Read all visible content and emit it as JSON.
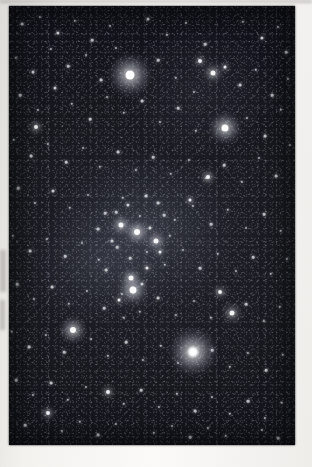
{
  "image": {
    "kind": "photograph-scan",
    "subject": "Orion constellation night sky star field",
    "caption": "",
    "background_color": "#f2f0ed",
    "sky_color": "#14151b",
    "star_color": "#ffffff",
    "frame": {
      "x": 9,
      "y": 6,
      "width": 286,
      "height": 439
    }
  },
  "photo": {
    "nebulosity": [
      {
        "name": "belt-sword-glow",
        "cx": 48,
        "cy": 51,
        "rx": 30,
        "ry": 17,
        "alpha": 0.2
      },
      {
        "name": "west-glow",
        "cx": 31,
        "cy": 59,
        "rx": 23,
        "ry": 13,
        "alpha": 0.14
      },
      {
        "name": "north-glow",
        "cx": 67,
        "cy": 19,
        "rx": 27,
        "ry": 15,
        "alpha": 0.1
      }
    ],
    "bright_stars": [
      {
        "name": "betelgeuse",
        "x": 130,
        "y": 75,
        "size": 9,
        "halo": 40,
        "intensity": 1.0
      },
      {
        "name": "rigel",
        "x": 193,
        "y": 352,
        "size": 10,
        "halo": 46,
        "intensity": 1.0
      },
      {
        "name": "bellatrix",
        "x": 225,
        "y": 128,
        "size": 7,
        "halo": 30,
        "intensity": 0.9
      },
      {
        "name": "saiph",
        "x": 73,
        "y": 330,
        "size": 6,
        "halo": 26,
        "intensity": 0.82
      },
      {
        "name": "mintaka",
        "x": 137,
        "y": 232,
        "size": 6,
        "halo": 22,
        "intensity": 0.85
      },
      {
        "name": "alnilam",
        "x": 121,
        "y": 225,
        "size": 5,
        "halo": 17,
        "intensity": 0.75
      },
      {
        "name": "alnitak",
        "x": 156,
        "y": 241,
        "size": 5,
        "halo": 16,
        "intensity": 0.72
      },
      {
        "name": "orion-nebula",
        "x": 133,
        "y": 290,
        "size": 7,
        "halo": 24,
        "intensity": 0.9
      },
      {
        "name": "sword-star",
        "x": 131,
        "y": 278,
        "size": 5,
        "halo": 15,
        "intensity": 0.76
      },
      {
        "name": "meissa",
        "x": 213,
        "y": 73,
        "size": 5,
        "halo": 16,
        "intensity": 0.72
      },
      {
        "name": "phi-orionis",
        "x": 208,
        "y": 177,
        "size": 4,
        "halo": 13,
        "intensity": 0.62
      },
      {
        "name": "eta-leporis",
        "x": 232,
        "y": 313,
        "size": 5,
        "halo": 15,
        "intensity": 0.68
      },
      {
        "name": "tau-orionis",
        "x": 220,
        "y": 292,
        "size": 4,
        "halo": 11,
        "intensity": 0.58
      },
      {
        "name": "pi-orionis",
        "x": 48,
        "y": 413,
        "size": 4,
        "halo": 12,
        "intensity": 0.6
      },
      {
        "name": "delta-leporis",
        "x": 108,
        "y": 392,
        "size": 4,
        "halo": 11,
        "intensity": 0.56
      },
      {
        "name": "cursa",
        "x": 36,
        "y": 127,
        "size": 4,
        "halo": 11,
        "intensity": 0.55
      },
      {
        "name": "zeta-tauri",
        "x": 200,
        "y": 61,
        "size": 4,
        "halo": 10,
        "intensity": 0.54
      },
      {
        "name": "chi-orionis",
        "x": 225,
        "y": 67,
        "size": 3,
        "halo": 8,
        "intensity": 0.5
      },
      {
        "name": "nu-orionis",
        "x": 190,
        "y": 200,
        "size": 3,
        "halo": 9,
        "intensity": 0.5
      },
      {
        "name": "sigma-orionis",
        "x": 160,
        "y": 252,
        "size": 3,
        "halo": 8,
        "intensity": 0.48
      },
      {
        "name": "iota-orionis",
        "x": 119,
        "y": 300,
        "size": 3,
        "halo": 8,
        "intensity": 0.48
      },
      {
        "name": "upsilon-orionis",
        "x": 147,
        "y": 268,
        "size": 3,
        "halo": 7,
        "intensity": 0.46
      }
    ],
    "field_stars": [
      [
        22,
        24,
        1.4
      ],
      [
        40,
        17,
        1.1
      ],
      [
        58,
        33,
        1.6
      ],
      [
        75,
        21,
        1.2
      ],
      [
        92,
        40,
        1.3
      ],
      [
        110,
        26,
        1.0
      ],
      [
        148,
        19,
        1.5
      ],
      [
        167,
        35,
        1.2
      ],
      [
        186,
        23,
        1.1
      ],
      [
        205,
        44,
        1.3
      ],
      [
        243,
        22,
        1.2
      ],
      [
        262,
        38,
        1.6
      ],
      [
        278,
        27,
        1.1
      ],
      [
        286,
        52,
        1.3
      ],
      [
        16,
        58,
        1.2
      ],
      [
        33,
        72,
        1.5
      ],
      [
        51,
        49,
        1.1
      ],
      [
        68,
        66,
        1.3
      ],
      [
        86,
        55,
        1.0
      ],
      [
        101,
        80,
        1.4
      ],
      [
        116,
        48,
        1.1
      ],
      [
        158,
        60,
        1.3
      ],
      [
        176,
        78,
        1.2
      ],
      [
        194,
        92,
        1.1
      ],
      [
        240,
        85,
        1.4
      ],
      [
        256,
        70,
        1.2
      ],
      [
        272,
        95,
        1.3
      ],
      [
        288,
        79,
        1.1
      ],
      [
        20,
        95,
        1.3
      ],
      [
        38,
        110,
        1.1
      ],
      [
        55,
        88,
        1.5
      ],
      [
        72,
        104,
        1.2
      ],
      [
        90,
        119,
        1.3
      ],
      [
        107,
        97,
        1.0
      ],
      [
        124,
        113,
        1.2
      ],
      [
        142,
        101,
        1.4
      ],
      [
        160,
        122,
        1.1
      ],
      [
        178,
        108,
        1.3
      ],
      [
        196,
        131,
        1.2
      ],
      [
        247,
        118,
        1.1
      ],
      [
        265,
        136,
        1.4
      ],
      [
        281,
        110,
        1.2
      ],
      [
        14,
        140,
        1.2
      ],
      [
        31,
        156,
        1.4
      ],
      [
        48,
        144,
        1.1
      ],
      [
        66,
        162,
        1.3
      ],
      [
        83,
        148,
        1.0
      ],
      [
        100,
        167,
        1.2
      ],
      [
        118,
        152,
        1.4
      ],
      [
        136,
        170,
        1.1
      ],
      [
        153,
        157,
        1.3
      ],
      [
        171,
        174,
        1.2
      ],
      [
        189,
        160,
        1.1
      ],
      [
        206,
        178,
        1.0
      ],
      [
        224,
        165,
        1.3
      ],
      [
        242,
        182,
        1.2
      ],
      [
        259,
        158,
        1.1
      ],
      [
        276,
        176,
        1.4
      ],
      [
        290,
        145,
        1.1
      ],
      [
        18,
        188,
        1.3
      ],
      [
        35,
        203,
        1.1
      ],
      [
        53,
        191,
        1.5
      ],
      [
        70,
        208,
        1.2
      ],
      [
        88,
        195,
        1.0
      ],
      [
        105,
        213,
        1.3
      ],
      [
        123,
        198,
        1.2
      ],
      [
        140,
        216,
        1.1
      ],
      [
        158,
        203,
        1.4
      ],
      [
        175,
        220,
        1.2
      ],
      [
        193,
        206,
        1.1
      ],
      [
        211,
        224,
        1.3
      ],
      [
        228,
        210,
        1.2
      ],
      [
        246,
        228,
        1.0
      ],
      [
        264,
        214,
        1.3
      ],
      [
        281,
        231,
        1.2
      ],
      [
        13,
        236,
        1.2
      ],
      [
        30,
        251,
        1.4
      ],
      [
        47,
        239,
        1.1
      ],
      [
        65,
        256,
        1.3
      ],
      [
        82,
        243,
        1.0
      ],
      [
        99,
        260,
        1.2
      ],
      [
        117,
        247,
        1.3
      ],
      [
        147,
        252,
        1.1
      ],
      [
        165,
        265,
        1.2
      ],
      [
        183,
        250,
        1.0
      ],
      [
        200,
        268,
        1.3
      ],
      [
        218,
        254,
        1.2
      ],
      [
        236,
        271,
        1.1
      ],
      [
        253,
        257,
        1.3
      ],
      [
        271,
        274,
        1.2
      ],
      [
        287,
        259,
        1.1
      ],
      [
        17,
        284,
        1.3
      ],
      [
        34,
        299,
        1.1
      ],
      [
        52,
        287,
        1.4
      ],
      [
        69,
        304,
        1.2
      ],
      [
        87,
        291,
        1.0
      ],
      [
        104,
        308,
        1.3
      ],
      [
        122,
        294,
        1.1
      ],
      [
        140,
        312,
        1.2
      ],
      [
        158,
        298,
        1.4
      ],
      [
        176,
        315,
        1.1
      ],
      [
        194,
        301,
        1.0
      ],
      [
        211,
        318,
        1.2
      ],
      [
        246,
        304,
        1.3
      ],
      [
        264,
        321,
        1.1
      ],
      [
        280,
        307,
        1.2
      ],
      [
        12,
        332,
        1.2
      ],
      [
        29,
        347,
        1.4
      ],
      [
        46,
        335,
        1.1
      ],
      [
        64,
        352,
        1.3
      ],
      [
        91,
        339,
        1.0
      ],
      [
        108,
        356,
        1.2
      ],
      [
        126,
        342,
        1.3
      ],
      [
        143,
        360,
        1.1
      ],
      [
        161,
        346,
        1.2
      ],
      [
        178,
        363,
        1.0
      ],
      [
        212,
        350,
        1.3
      ],
      [
        230,
        367,
        1.2
      ],
      [
        248,
        353,
        1.1
      ],
      [
        266,
        370,
        1.3
      ],
      [
        283,
        355,
        1.2
      ],
      [
        16,
        380,
        1.3
      ],
      [
        33,
        395,
        1.1
      ],
      [
        51,
        383,
        1.4
      ],
      [
        68,
        400,
        1.2
      ],
      [
        86,
        387,
        1.0
      ],
      [
        124,
        404,
        1.2
      ],
      [
        141,
        390,
        1.3
      ],
      [
        159,
        407,
        1.1
      ],
      [
        177,
        394,
        1.2
      ],
      [
        195,
        411,
        1.4
      ],
      [
        212,
        397,
        1.1
      ],
      [
        230,
        414,
        1.2
      ],
      [
        248,
        401,
        1.3
      ],
      [
        265,
        418,
        1.1
      ],
      [
        282,
        403,
        1.2
      ],
      [
        25,
        425,
        1.3
      ],
      [
        62,
        431,
        1.1
      ],
      [
        80,
        422,
        1.2
      ],
      [
        98,
        435,
        1.4
      ],
      [
        116,
        424,
        1.1
      ],
      [
        154,
        433,
        1.2
      ],
      [
        172,
        426,
        1.0
      ],
      [
        190,
        437,
        1.3
      ],
      [
        208,
        428,
        1.1
      ],
      [
        226,
        436,
        1.2
      ],
      [
        262,
        430,
        1.1
      ],
      [
        278,
        438,
        1.3
      ],
      [
        128,
        205,
        1.6
      ],
      [
        146,
        196,
        1.4
      ],
      [
        112,
        241,
        1.5
      ],
      [
        130,
        258,
        1.3
      ],
      [
        150,
        228,
        1.6
      ],
      [
        164,
        215,
        1.3
      ],
      [
        106,
        270,
        1.4
      ],
      [
        124,
        318,
        1.2
      ],
      [
        142,
        284,
        1.5
      ],
      [
        116,
        212,
        1.3
      ],
      [
        170,
        236,
        1.2
      ],
      [
        98,
        229,
        1.4
      ]
    ]
  }
}
